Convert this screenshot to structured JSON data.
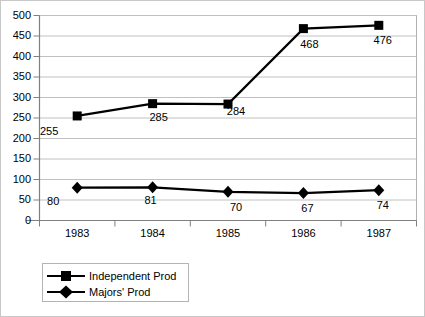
{
  "chart_data": {
    "type": "line",
    "title": "",
    "xlabel": "",
    "ylabel": "",
    "categories": [
      "1983",
      "1984",
      "1985",
      "1986",
      "1987"
    ],
    "ylim": [
      0,
      500
    ],
    "yticks": [
      "0",
      "50",
      "100",
      "150",
      "200",
      "250",
      "300",
      "350",
      "400",
      "450",
      "500"
    ],
    "grid": true,
    "legend_position": "bottom-left",
    "series": [
      {
        "name": "Independent Prod",
        "marker": "square",
        "color": "#000000",
        "values": [
          255,
          285,
          284,
          468,
          476
        ],
        "labels": [
          "255",
          "285",
          "284",
          "468",
          "476"
        ]
      },
      {
        "name": "Majors' Prod",
        "marker": "diamond",
        "color": "#000000",
        "values": [
          80,
          81,
          70,
          67,
          74
        ],
        "labels": [
          "80",
          "81",
          "70",
          "67",
          "74"
        ]
      }
    ]
  },
  "legend": {
    "items": [
      {
        "label": "Independent Prod",
        "marker": "square-marker-icon"
      },
      {
        "label": "Majors' Prod",
        "marker": "diamond-marker-icon"
      }
    ]
  },
  "axes": {
    "y": {
      "min": 0,
      "max": 500,
      "step": 50
    },
    "x": {
      "categories": [
        "1983",
        "1984",
        "1985",
        "1986",
        "1987"
      ]
    }
  }
}
